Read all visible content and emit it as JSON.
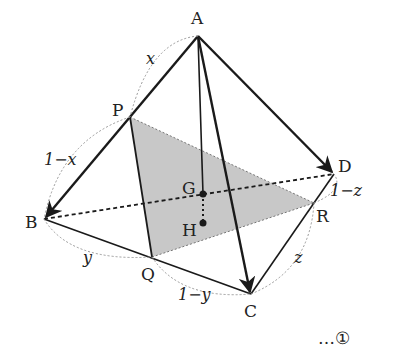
{
  "figure": {
    "type": "tetrahedron-vector-diagram",
    "vertices": {
      "A": {
        "label": "A",
        "x": 198,
        "y": 36
      },
      "B": {
        "label": "B",
        "x": 44,
        "y": 219
      },
      "C": {
        "label": "C",
        "x": 251,
        "y": 294
      },
      "D": {
        "label": "D",
        "x": 334,
        "y": 174
      }
    },
    "points": {
      "P": {
        "label": "P",
        "x": 130,
        "y": 117
      },
      "Q": {
        "label": "Q",
        "x": 152,
        "y": 257
      },
      "R": {
        "label": "R",
        "x": 314,
        "y": 203
      },
      "G": {
        "label": "G",
        "x": 203,
        "y": 194
      },
      "H": {
        "label": "H",
        "x": 203,
        "y": 223
      }
    },
    "segment_labels": {
      "AP": "x",
      "PB": "1−x",
      "BQ": "y",
      "QC": "1−y",
      "CR": "z",
      "RD": "1−z"
    },
    "shaded_region": "triangle PQR",
    "shade_color": "#c8c8c8",
    "line_color": "#1a1a1a",
    "dotted_color": "#888888"
  },
  "equation_marker": "…①"
}
